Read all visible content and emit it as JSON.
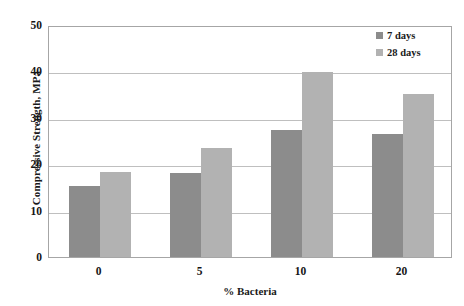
{
  "chart_data": {
    "type": "bar",
    "title": "",
    "xlabel": "% Bacteria",
    "ylabel": "Compressive Strength, MPa",
    "categories": [
      "0",
      "5",
      "10",
      "20"
    ],
    "series": [
      {
        "name": "7 days",
        "color": "#8c8c8c",
        "values": [
          15.4,
          18.0,
          27.4,
          26.5
        ]
      },
      {
        "name": "28 days",
        "color": "#b2b2b2",
        "values": [
          18.3,
          23.5,
          39.8,
          35.2
        ]
      }
    ],
    "ylim": [
      0,
      50
    ],
    "yticks": [
      0,
      10,
      20,
      30,
      40,
      50
    ],
    "ytick_labels": [
      "0",
      "10",
      "20",
      "30",
      "40",
      "50"
    ],
    "grid": "horizontal",
    "legend_position": "top-right",
    "frame_color": "#a6a6a6",
    "gridline_color": "#bfbfbf",
    "background": "#ffffff"
  }
}
